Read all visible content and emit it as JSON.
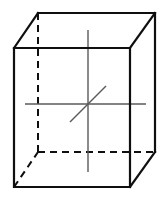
{
  "figure": {
    "type": "line-drawing",
    "canvas": {
      "width": 166,
      "height": 202,
      "background": "#ffffff"
    },
    "colors": {
      "visible_edge": "#0f0f0f",
      "hidden_edge": "#0f0f0f",
      "axis": "#5a5a5a",
      "background": "#ffffff"
    },
    "stroke": {
      "visible_edge_width": 2.2,
      "hidden_edge_width": 2.0,
      "axis_width": 1.4,
      "hidden_dash_pattern": "7,5"
    },
    "vertices": {
      "front_top_left": {
        "x": 14,
        "y": 48
      },
      "front_top_right": {
        "x": 130,
        "y": 48
      },
      "front_bottom_right": {
        "x": 130,
        "y": 187
      },
      "front_bottom_left": {
        "x": 14,
        "y": 187
      },
      "back_top_left": {
        "x": 38,
        "y": 13
      },
      "back_top_right": {
        "x": 155,
        "y": 13
      },
      "back_bottom_right": {
        "x": 155,
        "y": 152
      },
      "back_bottom_left": {
        "x": 38,
        "y": 152
      }
    },
    "depth_offset": {
      "dx": 24,
      "dy": -35
    },
    "edges": [
      {
        "name": "front-top-edge",
        "from": "front_top_left",
        "to": "front_top_right",
        "style": "solid"
      },
      {
        "name": "front-right-edge",
        "from": "front_top_right",
        "to": "front_bottom_right",
        "style": "solid"
      },
      {
        "name": "front-bottom-edge",
        "from": "front_bottom_right",
        "to": "front_bottom_left",
        "style": "solid"
      },
      {
        "name": "front-left-edge",
        "from": "front_bottom_left",
        "to": "front_top_left",
        "style": "solid"
      },
      {
        "name": "back-top-edge",
        "from": "back_top_left",
        "to": "back_top_right",
        "style": "solid"
      },
      {
        "name": "back-right-edge",
        "from": "back_top_right",
        "to": "back_bottom_right",
        "style": "solid"
      },
      {
        "name": "top-left-depth-edge",
        "from": "front_top_left",
        "to": "back_top_left",
        "style": "solid"
      },
      {
        "name": "top-right-depth-edge",
        "from": "front_top_right",
        "to": "back_top_right",
        "style": "solid"
      },
      {
        "name": "bottom-right-depth-edge",
        "from": "front_bottom_right",
        "to": "back_bottom_right",
        "style": "solid"
      },
      {
        "name": "back-left-edge",
        "from": "back_top_left",
        "to": "back_bottom_left",
        "style": "dashed"
      },
      {
        "name": "back-bottom-edge",
        "from": "back_bottom_left",
        "to": "back_bottom_right",
        "style": "dashed"
      },
      {
        "name": "bottom-left-depth-edge",
        "from": "front_bottom_left",
        "to": "back_bottom_left",
        "style": "dashed"
      }
    ],
    "center": {
      "x": 88,
      "y": 104
    },
    "axes": [
      {
        "name": "vertical-axis",
        "orientation": "vertical",
        "from": {
          "x": 88,
          "y": 30
        },
        "to": {
          "x": 88,
          "y": 172
        },
        "length": 142
      },
      {
        "name": "horizontal-axis",
        "orientation": "horizontal",
        "from": {
          "x": 25,
          "y": 104
        },
        "to": {
          "x": 146,
          "y": 104
        },
        "length": 121
      },
      {
        "name": "depth-axis",
        "orientation": "oblique-45",
        "from": {
          "x": 70,
          "y": 122
        },
        "to": {
          "x": 106,
          "y": 86
        },
        "length": 51
      }
    ],
    "labels": []
  }
}
